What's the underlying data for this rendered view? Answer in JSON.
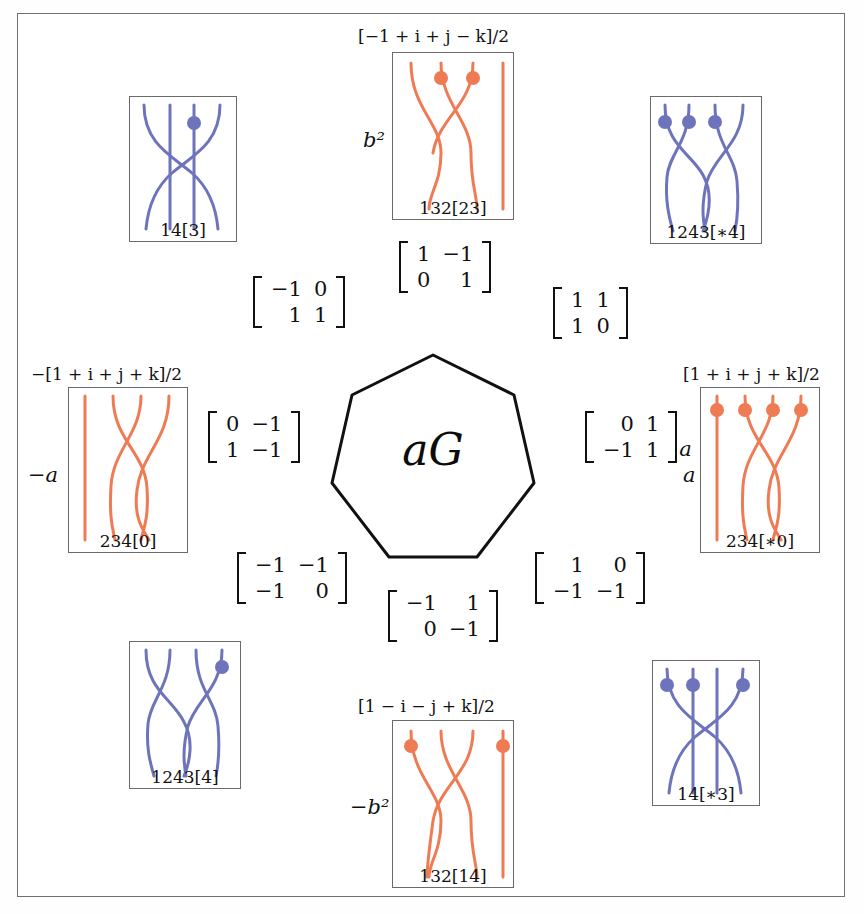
{
  "figure": {
    "center_label": "aG",
    "colors": {
      "blue_strand": "#6e74bb",
      "orange_strand": "#ef7b55",
      "box_border": "#6a6a6a",
      "frame_border": "#6f6f6f",
      "text": "#111111"
    }
  },
  "boxes": {
    "top_center": {
      "quaternion": "[−1 + i + j − k]/2",
      "side_label": "b²",
      "caption": "132[23]",
      "color": "orange",
      "strands": 4,
      "dots": [
        2,
        3
      ]
    },
    "top_left": {
      "quaternion": "",
      "side_label": "",
      "caption": "14[3]",
      "color": "blue",
      "strands": 4,
      "dots": [
        3
      ]
    },
    "top_right": {
      "quaternion": "",
      "side_label": "",
      "caption": "1243[∗4]",
      "color": "blue",
      "strands": 4,
      "dots": [
        1,
        2,
        3
      ]
    },
    "left": {
      "quaternion": "−[1 + i + j + k]/2",
      "side_label": "−a",
      "caption": "234[0]",
      "color": "orange",
      "strands": 4,
      "dots": []
    },
    "right": {
      "quaternion": "[1 + i + j + k]/2",
      "side_label": "a",
      "caption": "234[∗0]",
      "color": "orange",
      "strands": 4,
      "dots": [
        1,
        2,
        3,
        4
      ]
    },
    "bottom_left": {
      "quaternion": "",
      "side_label": "",
      "caption": "1243[4]",
      "color": "blue",
      "strands": 4,
      "dots": [
        4
      ]
    },
    "bottom_center": {
      "quaternion": "[1 − i − j + k]/2",
      "side_label": "−b²",
      "caption": "132[14]",
      "color": "orange",
      "strands": 4,
      "dots": [
        1,
        4
      ]
    },
    "bottom_right": {
      "quaternion": "",
      "side_label": "",
      "caption": "14[∗3]",
      "color": "blue",
      "strands": 4,
      "dots": [
        1,
        2,
        4
      ]
    }
  },
  "matrices": {
    "top_center": {
      "rows": [
        [
          "1",
          "−1"
        ],
        [
          "0",
          "1"
        ]
      ],
      "suffix": ""
    },
    "upper_left": {
      "rows": [
        [
          "−1",
          "0"
        ],
        [
          "1",
          "1"
        ]
      ],
      "suffix": ""
    },
    "upper_right": {
      "rows": [
        [
          "1",
          "1"
        ],
        [
          "1",
          "0"
        ]
      ],
      "suffix": ""
    },
    "left": {
      "rows": [
        [
          "0",
          "−1"
        ],
        [
          "1",
          "−1"
        ]
      ],
      "suffix": ""
    },
    "right": {
      "rows": [
        [
          "0",
          "1"
        ],
        [
          "−1",
          "1"
        ]
      ],
      "suffix": "a"
    },
    "lower_left": {
      "rows": [
        [
          "−1",
          "−1"
        ],
        [
          "−1",
          "0"
        ]
      ],
      "suffix": ""
    },
    "lower_right": {
      "rows": [
        [
          "1",
          "0"
        ],
        [
          "−1",
          "−1"
        ]
      ],
      "suffix": ""
    },
    "bottom_center": {
      "rows": [
        [
          "−1",
          "1"
        ],
        [
          "0",
          "−1"
        ]
      ],
      "suffix": ""
    }
  }
}
